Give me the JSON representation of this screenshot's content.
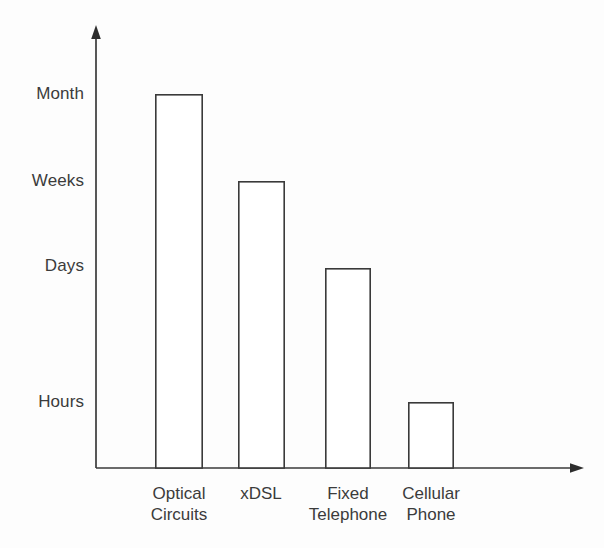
{
  "chart_data": {
    "type": "bar",
    "title": "",
    "subtitle": "",
    "xlabel": "",
    "ylabel": "",
    "grid": false,
    "legend": "none",
    "orientation": "vertical",
    "bar_style": "outline-unfilled",
    "categories": [
      "Optical Circuits",
      "xDSL",
      "Fixed Telephone",
      "Cellular Phone"
    ],
    "category_lines": [
      [
        "Optical",
        "Circuits"
      ],
      [
        "xDSL"
      ],
      [
        "Fixed",
        "Telephone"
      ],
      [
        "Cellular",
        "Phone"
      ]
    ],
    "y_tick_labels": [
      "Hours",
      "Days",
      "Weeks",
      "Month"
    ],
    "y_tick_order_top_to_bottom": [
      "Month",
      "Weeks",
      "Days",
      "Hours"
    ],
    "y_scale": "ordinal-time",
    "values": [
      "Month",
      "Weeks",
      "Days",
      "Hours"
    ],
    "values_numeric": [
      4,
      3,
      2,
      1
    ],
    "ylim": [
      0,
      4.6
    ],
    "series": [
      {
        "name": "Provisioning time",
        "values": [
          "Month",
          "Weeks",
          "Days",
          "Hours"
        ],
        "values_numeric": [
          4,
          3,
          2,
          1
        ]
      }
    ],
    "points": [
      {
        "category": "Optical Circuits",
        "value_label": "Month",
        "value_numeric": 4
      },
      {
        "category": "xDSL",
        "value_label": "Weeks",
        "value_numeric": 3
      },
      {
        "category": "Fixed Telephone",
        "value_label": "Days",
        "value_numeric": 2
      },
      {
        "category": "Cellular Phone",
        "value_label": "Hours",
        "value_numeric": 1
      }
    ],
    "annotations": [],
    "colors": {
      "bar_fill": "#ffffff",
      "bar_stroke": "#3a3a3a",
      "axis": "#3a3a3a",
      "text": "#3b3b3b",
      "background": "#fdfdfd"
    }
  },
  "y_axis": {
    "ticks": [
      {
        "label": "Month",
        "y": 94
      },
      {
        "label": "Weeks",
        "y": 181
      },
      {
        "label": "Days",
        "y": 266
      },
      {
        "label": "Hours",
        "y": 402
      }
    ]
  },
  "x_axis": {
    "categories": [
      {
        "line1": "Optical",
        "line2": "Circuits"
      },
      {
        "line1": "xDSL",
        "line2": ""
      },
      {
        "line1": "Fixed",
        "line2": "Telephone"
      },
      {
        "line1": "Cellular",
        "line2": "Phone"
      }
    ]
  },
  "bars": [
    {
      "name": "optical-circuits",
      "x": 155,
      "width": 47,
      "top": 94
    },
    {
      "name": "xdsl",
      "x": 238,
      "width": 46,
      "top": 181
    },
    {
      "name": "fixed-telephone",
      "x": 325,
      "width": 45,
      "top": 268
    },
    {
      "name": "cellular-phone",
      "x": 408,
      "width": 45,
      "top": 402
    }
  ]
}
